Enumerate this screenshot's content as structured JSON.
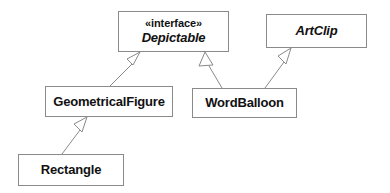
{
  "diagram": {
    "type": "uml-class-diagram",
    "canvas": {
      "width": 390,
      "height": 193,
      "background": "#ffffff"
    },
    "style": {
      "box_fill": "#ffffff",
      "box_border": "#8a8a8a",
      "edge_color": "#8a8a8a",
      "text_color": "#111111"
    },
    "classes": [
      {
        "id": "depictable",
        "stereotype": "«interface»",
        "name": "Depictable",
        "abstract": true,
        "x": 118,
        "y": 11,
        "width": 111,
        "height": 41
      },
      {
        "id": "artclip",
        "stereotype": "",
        "name": "ArtClip",
        "abstract": true,
        "x": 266,
        "y": 14,
        "width": 101,
        "height": 34
      },
      {
        "id": "geometricalfigure",
        "stereotype": "",
        "name": "GeometricalFigure",
        "abstract": false,
        "x": 45,
        "y": 86,
        "width": 128,
        "height": 31
      },
      {
        "id": "wordballoon",
        "stereotype": "",
        "name": "WordBalloon",
        "abstract": false,
        "x": 192,
        "y": 88,
        "width": 105,
        "height": 30
      },
      {
        "id": "rectangle",
        "stereotype": "",
        "name": "Rectangle",
        "abstract": false,
        "x": 18,
        "y": 154,
        "width": 106,
        "height": 32
      }
    ],
    "relationships": [
      {
        "id": "geometricalfigure-implements-depictable",
        "kind": "generalization",
        "from": "GeometricalFigure",
        "to": "Depictable",
        "arrowhead": "hollow-triangle"
      },
      {
        "id": "wordballoon-implements-depictable",
        "kind": "generalization",
        "from": "WordBalloon",
        "to": "Depictable",
        "arrowhead": "hollow-triangle"
      },
      {
        "id": "wordballoon-extends-artclip",
        "kind": "generalization",
        "from": "WordBalloon",
        "to": "ArtClip",
        "arrowhead": "hollow-triangle"
      },
      {
        "id": "rectangle-extends-geometricalfigure",
        "kind": "generalization",
        "from": "Rectangle",
        "to": "GeometricalFigure",
        "arrowhead": "hollow-triangle"
      }
    ]
  }
}
